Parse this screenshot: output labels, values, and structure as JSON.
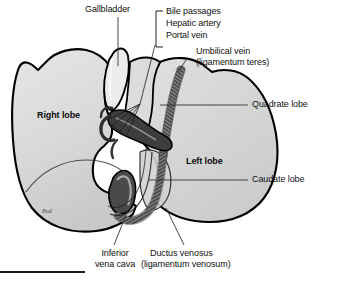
{
  "figure": {
    "signature": "Bud",
    "colors": {
      "outline": "#000000",
      "parenchyma": "#d8d8d8",
      "parenchyma_light": "#e4e4e4",
      "parenchyma_shade": "#c4c4c4",
      "vessel_dark": "#3a3a3a",
      "vessel_mid": "#6e6e6e",
      "leader": "#333333",
      "text": "#111111",
      "rule": "#1a1a1a"
    }
  },
  "labels": {
    "gallbladder": "Gallbladder",
    "bile_passages": "Bile passages",
    "hepatic_artery": "Hepatic artery",
    "portal_vein": "Portal vein",
    "umbilical_vein_line1": "Umbilical vein",
    "umbilical_vein_line2": "(ligamentum teres)",
    "quadrate_lobe": "Quadrate lobe",
    "caudate_lobe": "Caudate lobe",
    "right_lobe": "Right lobe",
    "left_lobe": "Left lobe",
    "inferior_vena_cava_line1": "Inferior",
    "inferior_vena_cava_line2": "vena cava",
    "ductus_venosus_line1": "Ductus venosus",
    "ductus_venosus_line2": "(ligamentum venosum)"
  }
}
